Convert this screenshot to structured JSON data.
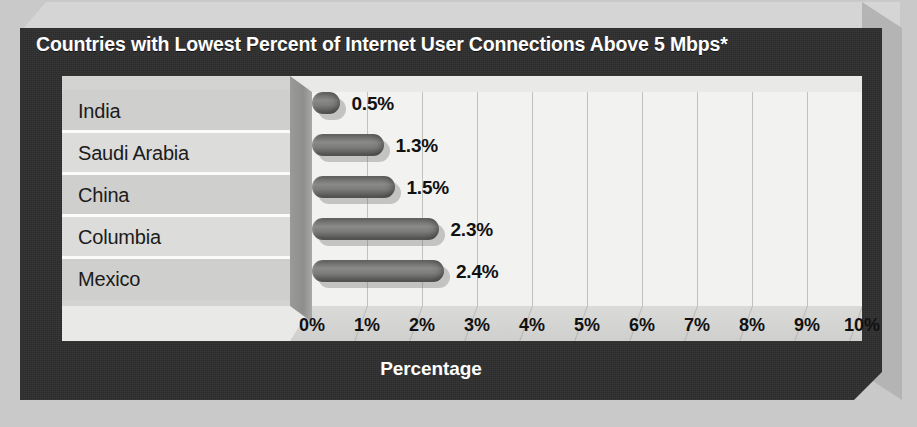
{
  "chart_data": {
    "type": "bar",
    "orientation": "horizontal",
    "title": "Countries with Lowest Percent of Internet User Connections Above 5 Mbps*",
    "categories": [
      "India",
      "Saudi Arabia",
      "China",
      "Columbia",
      "Mexico"
    ],
    "values": [
      0.5,
      1.3,
      1.5,
      2.3,
      2.4
    ],
    "value_labels": [
      "0.5%",
      "1.3%",
      "1.5%",
      "2.3%",
      "2.4%"
    ],
    "xlabel": "Percentage",
    "ylabel": "",
    "xlim": [
      0,
      10
    ],
    "xticks": [
      0,
      1,
      2,
      3,
      4,
      5,
      6,
      7,
      8,
      9,
      10
    ],
    "xtick_labels": [
      "0%",
      "1%",
      "2%",
      "3%",
      "4%",
      "5%",
      "6%",
      "7%",
      "8%",
      "9%",
      "10%"
    ],
    "grid": "vertical",
    "legend": "none",
    "style": "3d-cylinder-bars"
  },
  "colors": {
    "frame_dark": "#2e2e2e",
    "frame_bevel_light": "#d5d5d5",
    "frame_bevel_right": "#b4b4b4",
    "plot_background": "#f2f2f0",
    "category_band_odd": "#cfcfcd",
    "category_band_even": "#dcdcda",
    "bar_fill": "#7b7b79",
    "title_text": "#ffffff",
    "label_text": "#111111"
  }
}
